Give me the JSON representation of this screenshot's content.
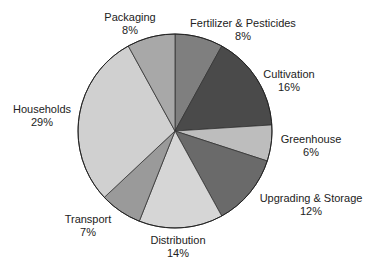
{
  "chart_data": {
    "type": "pie",
    "title": "",
    "start_angle_deg": 0,
    "direction": "clockwise",
    "categories": [
      "Fertilizer & Pesticides",
      "Cultivation",
      "Greenhouse",
      "Upgrading & Storage",
      "Distribution",
      "Transport",
      "Households",
      "Packaging"
    ],
    "values": [
      8,
      16,
      6,
      12,
      14,
      7,
      29,
      8
    ],
    "unit": "%",
    "colors": [
      "#7f7f7f",
      "#4a4a4a",
      "#bdbdbd",
      "#6a6a6a",
      "#d6d6d6",
      "#9a9a9a",
      "#d0d0d0",
      "#a8a8a8"
    ],
    "legend": "none (data labels outside)"
  },
  "labels": [
    {
      "name": "Fertilizer & Pesticides",
      "pct": "8%",
      "x": 243,
      "y": 17
    },
    {
      "name": "Cultivation",
      "pct": "16%",
      "x": 289,
      "y": 68
    },
    {
      "name": "Greenhouse",
      "pct": "6%",
      "x": 311,
      "y": 133
    },
    {
      "name": "Upgrading & Storage",
      "pct": "12%",
      "x": 311,
      "y": 192
    },
    {
      "name": "Distribution",
      "pct": "14%",
      "x": 178,
      "y": 234
    },
    {
      "name": "Transport",
      "pct": "7%",
      "x": 88,
      "y": 213
    },
    {
      "name": "Households",
      "pct": "29%",
      "x": 42,
      "y": 103
    },
    {
      "name": "Packaging",
      "pct": "8%",
      "x": 130,
      "y": 11
    }
  ]
}
